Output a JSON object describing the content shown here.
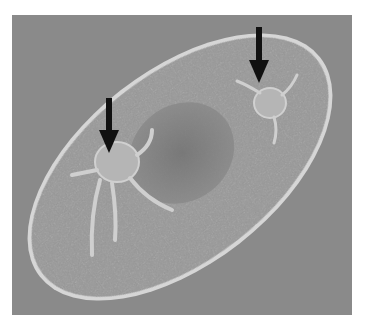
{
  "image": {
    "description": "Phase-contrast micrograph of an oval ciliate cell containing two engulfed organisms, each indicated by a black arrow",
    "background_color": "#8a8a8a",
    "cell_color": "#9a9a9a",
    "membrane_color": "#d8d8d8",
    "arrows": [
      {
        "label": "arrow-upper-right",
        "tip_x": 259,
        "tip_y": 83,
        "color": "#111111"
      },
      {
        "label": "arrow-left",
        "tip_x": 109,
        "tip_y": 153,
        "color": "#111111"
      }
    ]
  }
}
